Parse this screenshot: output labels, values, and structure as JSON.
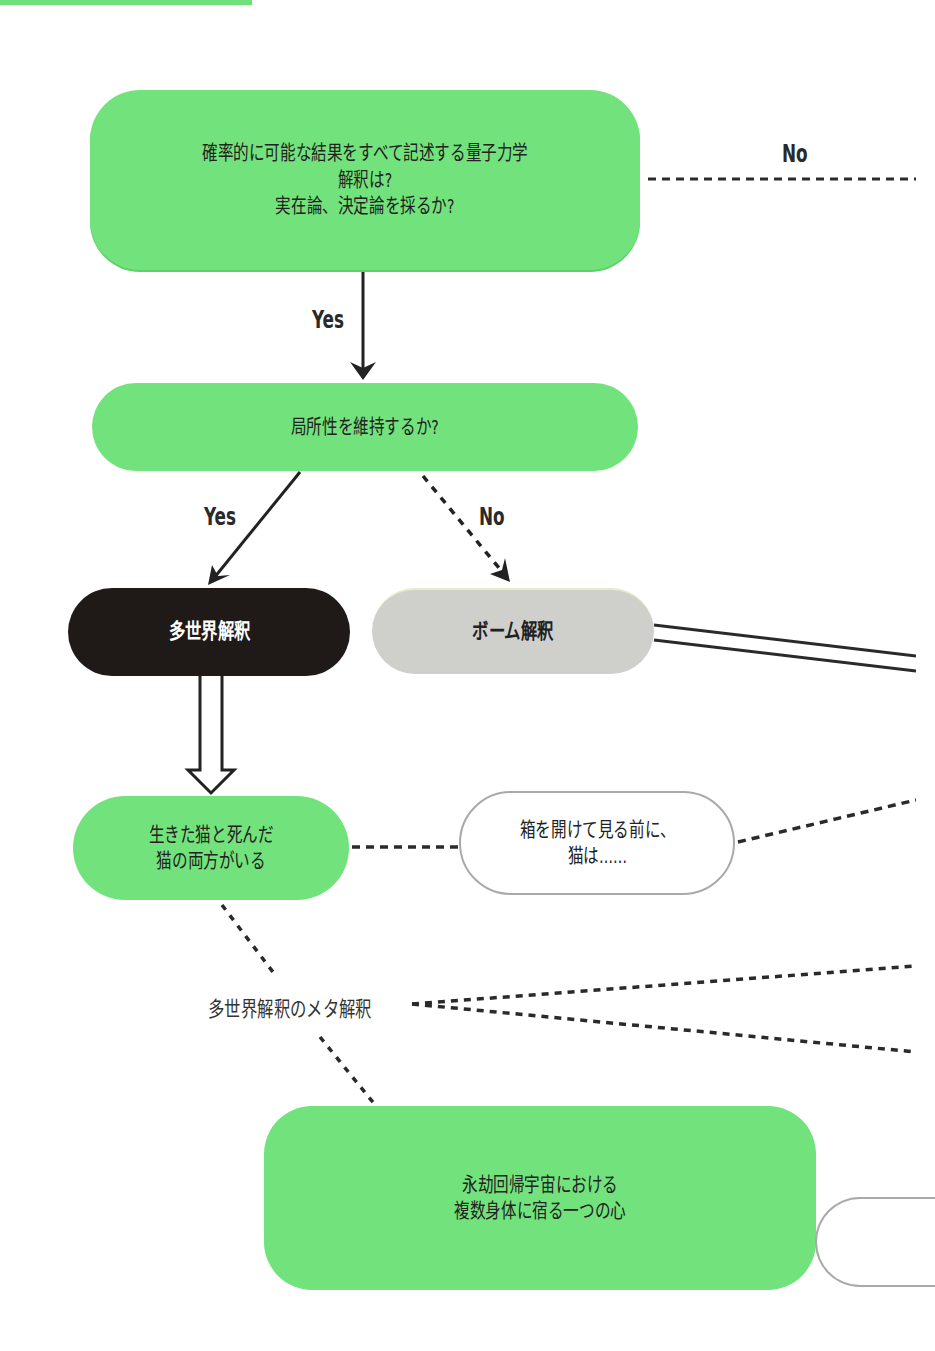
{
  "diagram": {
    "banner_color": "#6fe07a",
    "colors": {
      "green_node": "#72e27c",
      "black_node": "#1f1a18",
      "gray_node": "#cfd0cc",
      "outline_node_border": "#a9a9a9",
      "line": "#222222"
    },
    "nodes": {
      "q1": "確率的に可能な結果をすべて記述する量子力学\n解釈は?\n実在論、決定論を採るか?",
      "q2": "局所性を維持するか?",
      "many_worlds": "多世界解釈",
      "bohm": "ボーム解釈",
      "cat_both": "生きた猫と死んだ\n猫の両方がいる",
      "box_before": "箱を開けて見る前に、\n猫は……",
      "eternal": "永劫回帰宇宙における\n複数身体に宿る一つの心",
      "partial_right": ""
    },
    "edge_labels": {
      "q1_no": "No",
      "q1_yes": "Yes",
      "q2_yes": "Yes",
      "q2_no": "No"
    },
    "meta_label": "多世界解釈のメタ解釈"
  }
}
